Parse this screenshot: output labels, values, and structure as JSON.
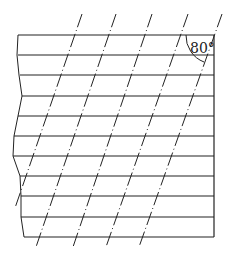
{
  "diagram": {
    "angle_label": "80°",
    "colors": {
      "line": "#222222",
      "background": "#ffffff"
    },
    "horizontal_lines": [
      {
        "y": 35,
        "x1": 18,
        "x2": 214
      },
      {
        "y": 55,
        "x1": 18,
        "x2": 214
      },
      {
        "y": 75,
        "x1": 20,
        "x2": 214
      },
      {
        "y": 96,
        "x1": 22,
        "x2": 214
      },
      {
        "y": 116,
        "x1": 18,
        "x2": 214
      },
      {
        "y": 136,
        "x1": 14,
        "x2": 214
      },
      {
        "y": 156,
        "x1": 13,
        "x2": 214
      },
      {
        "y": 176,
        "x1": 20,
        "x2": 214
      },
      {
        "y": 196,
        "x1": 21,
        "x2": 214
      },
      {
        "y": 217,
        "x1": 21,
        "x2": 214
      },
      {
        "y": 237,
        "x1": 24,
        "x2": 214
      }
    ],
    "slanted_lines": [
      {
        "x1": 82,
        "y1": 14,
        "x2": 15,
        "y2": 208
      },
      {
        "x1": 116,
        "y1": 14,
        "x2": 36,
        "y2": 247
      },
      {
        "x1": 152,
        "y1": 14,
        "x2": 73,
        "y2": 247
      },
      {
        "x1": 188,
        "y1": 14,
        "x2": 106,
        "y2": 247
      },
      {
        "x1": 222,
        "y1": 14,
        "x2": 139,
        "y2": 247
      }
    ]
  }
}
